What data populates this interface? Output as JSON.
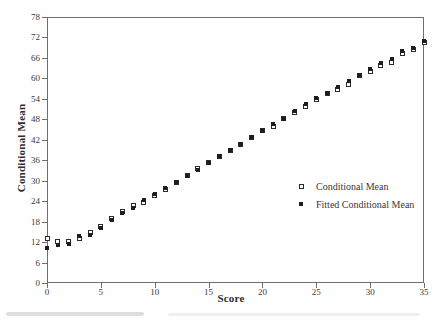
{
  "figure_title": "",
  "colors": {
    "background": "#fefefe",
    "frame": "#6e6e6e",
    "ink": "#3a3a3a",
    "marker": "#1d1d1d"
  },
  "legend": {
    "items": [
      {
        "label": "Conditional Mean",
        "marker": "open-square"
      },
      {
        "label": "Fitted Conditional Mean",
        "marker": "filled-square"
      }
    ]
  },
  "chart_data": {
    "type": "scatter",
    "title": "",
    "xlabel": "Score",
    "ylabel": "Conditional Mean",
    "xlim": [
      0,
      35
    ],
    "ylim": [
      0,
      78
    ],
    "x_ticks": [
      0,
      5,
      10,
      15,
      20,
      25,
      30,
      35
    ],
    "y_ticks": [
      0,
      6,
      12,
      18,
      24,
      30,
      36,
      42,
      48,
      54,
      60,
      66,
      72,
      78
    ],
    "grid": false,
    "legend_position": "inside-middle-right",
    "x": [
      0,
      1,
      2,
      3,
      4,
      5,
      6,
      7,
      8,
      9,
      10,
      11,
      12,
      13,
      14,
      15,
      16,
      17,
      18,
      19,
      20,
      21,
      22,
      23,
      24,
      25,
      26,
      27,
      28,
      29,
      30,
      31,
      32,
      33,
      34,
      35
    ],
    "series": [
      {
        "name": "Conditional Mean",
        "marker": "open-square",
        "values": [
          13.0,
          12.2,
          12.1,
          13.0,
          14.9,
          16.7,
          18.8,
          21.0,
          22.6,
          23.5,
          25.8,
          27.5,
          29.5,
          31.5,
          33.6,
          35.4,
          37.0,
          39.0,
          40.6,
          42.6,
          44.7,
          46.0,
          48.3,
          50.0,
          51.7,
          53.7,
          55.6,
          56.8,
          58.3,
          60.8,
          62.0,
          63.7,
          64.6,
          67.4,
          68.4,
          70.4
        ]
      },
      {
        "name": "Fitted Conditional Mean",
        "marker": "filled-square",
        "values": [
          10.2,
          11.0,
          11.5,
          13.8,
          14.1,
          16.2,
          18.4,
          20.6,
          22.0,
          24.3,
          26.1,
          27.8,
          29.7,
          31.3,
          33.1,
          35.1,
          37.1,
          39.0,
          40.9,
          42.8,
          44.7,
          46.5,
          48.2,
          50.5,
          52.5,
          54.2,
          55.7,
          57.6,
          59.1,
          61.1,
          62.8,
          64.4,
          65.8,
          68.0,
          69.0,
          71.0
        ]
      }
    ]
  }
}
